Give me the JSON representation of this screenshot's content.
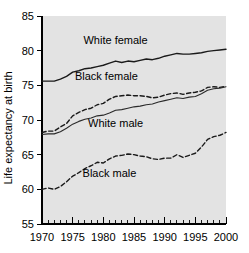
{
  "chart_data": {
    "type": "line",
    "title": "",
    "xlabel": "",
    "ylabel": "Life expectancy at birth",
    "xlim": [
      1970,
      2000
    ],
    "ylim": [
      55,
      85
    ],
    "ytick_labels": [
      "55",
      "60",
      "65",
      "70",
      "75",
      "80",
      "85"
    ],
    "yticks": [
      55,
      60,
      65,
      70,
      75,
      80,
      85
    ],
    "xtick_labels": [
      "1970",
      "1975",
      "1980",
      "1985",
      "1990",
      "1995",
      "2000"
    ],
    "xticks": [
      1970,
      1975,
      1980,
      1985,
      1990,
      1995,
      2000
    ],
    "minor_xtick_step": 1,
    "grid": false,
    "legend_position": "inline-annotations",
    "background_color": "#e3e3e3",
    "line_color": "#1a1a1a",
    "x": [
      1970,
      1971,
      1972,
      1973,
      1974,
      1975,
      1976,
      1977,
      1978,
      1979,
      1980,
      1981,
      1982,
      1983,
      1984,
      1985,
      1986,
      1987,
      1988,
      1989,
      1990,
      1991,
      1992,
      1993,
      1994,
      1995,
      1996,
      1997,
      1998,
      1999,
      2000
    ],
    "series": [
      {
        "name": "White female",
        "style": "solid",
        "label_x": 1982,
        "label_y": 81.6,
        "values": [
          75.6,
          75.6,
          75.6,
          75.9,
          76.3,
          76.9,
          77.1,
          77.4,
          77.5,
          77.7,
          77.9,
          78.2,
          78.5,
          78.3,
          78.5,
          78.4,
          78.6,
          78.8,
          78.7,
          78.9,
          79.2,
          79.4,
          79.6,
          79.5,
          79.5,
          79.6,
          79.7,
          79.9,
          80.0,
          80.1,
          80.2
        ]
      },
      {
        "name": "Black female",
        "style": "dashed",
        "label_x": 1980.5,
        "label_y": 76.4,
        "values": [
          68.2,
          68.4,
          68.4,
          69.0,
          69.5,
          70.6,
          71.1,
          71.5,
          71.7,
          72.2,
          72.4,
          73.0,
          73.4,
          73.5,
          73.6,
          73.5,
          73.5,
          73.4,
          73.2,
          73.3,
          73.6,
          73.8,
          73.9,
          73.7,
          73.9,
          74.0,
          74.2,
          74.7,
          74.8,
          74.7,
          74.9
        ]
      },
      {
        "name": "White male",
        "style": "solid-thin",
        "label_x": 1982,
        "label_y": 69.6,
        "values": [
          67.9,
          68.0,
          68.0,
          68.3,
          68.8,
          69.4,
          69.8,
          70.1,
          70.3,
          70.6,
          70.7,
          71.0,
          71.4,
          71.5,
          71.7,
          71.9,
          72.0,
          72.2,
          72.3,
          72.6,
          72.8,
          73.0,
          73.2,
          73.1,
          73.3,
          73.4,
          73.8,
          74.3,
          74.5,
          74.6,
          74.8
        ]
      },
      {
        "name": "Black male",
        "style": "dashed",
        "label_x": 1981,
        "label_y": 62.4,
        "values": [
          60.0,
          60.2,
          60.0,
          60.4,
          61.1,
          61.9,
          62.4,
          63.0,
          63.4,
          63.9,
          63.8,
          64.4,
          64.8,
          64.9,
          65.1,
          65.0,
          64.8,
          64.7,
          64.4,
          64.3,
          64.5,
          64.5,
          65.0,
          64.6,
          64.9,
          65.2,
          66.1,
          67.2,
          67.6,
          67.8,
          68.2
        ]
      }
    ]
  }
}
